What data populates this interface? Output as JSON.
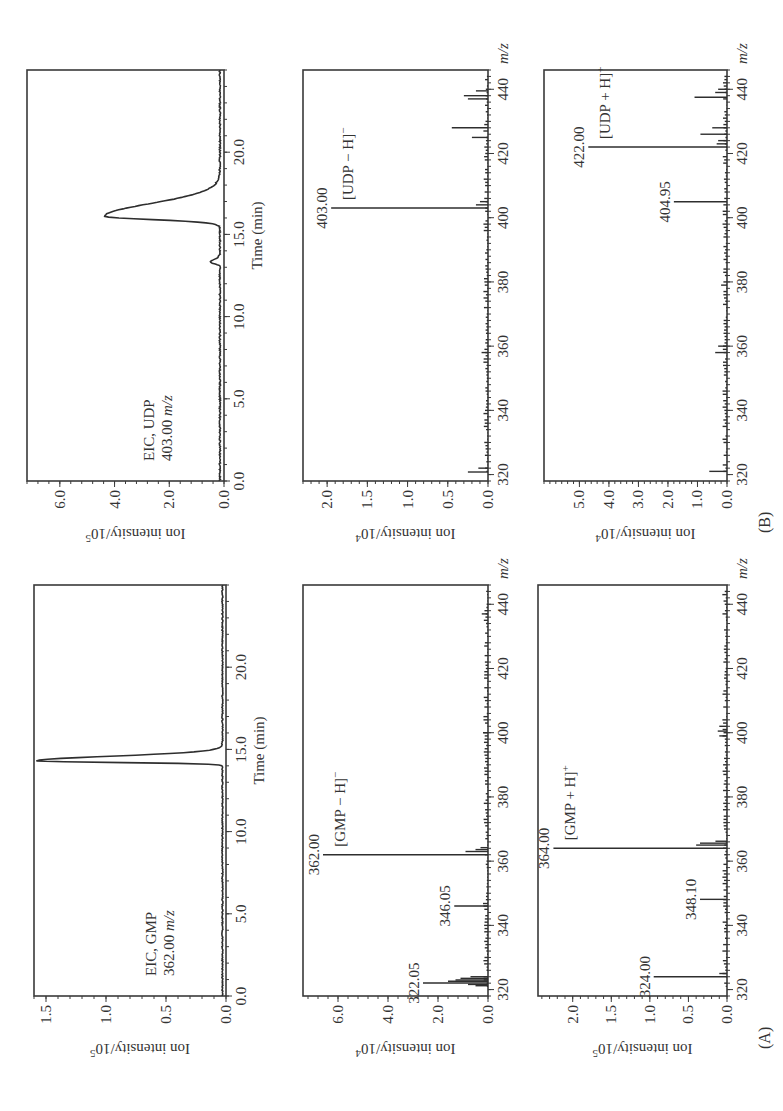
{
  "figure": {
    "panel_labels": [
      "(A)",
      "(B)"
    ],
    "colors": {
      "ink": "#2e2e2e",
      "background": "#ffffff"
    }
  },
  "chart_data": [
    {
      "id": "A-eic",
      "panel": "A",
      "type": "line",
      "title": "EIC, GMP",
      "subtitle": "362.00 m/z",
      "xlabel": "Time (min)",
      "ylabel": "Ion intensity/10^5",
      "xlim": [
        0,
        25
      ],
      "ylim": [
        0,
        1.6
      ],
      "xticks": [
        0.0,
        5.0,
        10.0,
        15.0,
        20.0
      ],
      "xtick_labels": [
        "0.0",
        "5.0",
        "10.0",
        "15.0",
        "20.0"
      ],
      "yticks": [
        0.0,
        0.5,
        1.0,
        1.5
      ],
      "ytick_labels": [
        "0.0",
        "0.5",
        "1.0",
        "1.5"
      ],
      "grid": false,
      "peaks": [
        {
          "x": 14.3,
          "y": 1.55,
          "width": 0.25,
          "tail": 0.6
        }
      ],
      "baseline": 0.03
    },
    {
      "id": "A-ms-neg",
      "panel": "A",
      "type": "bar",
      "title": "[GMP − H]⁻",
      "xlabel": "m/z",
      "ylabel": "Ion intensity/10^4",
      "xlim": [
        318,
        446
      ],
      "ylim": [
        0,
        7.4
      ],
      "xticks": [
        320,
        340,
        360,
        380,
        400,
        420,
        440
      ],
      "xtick_labels": [
        "320",
        "340",
        "360",
        "380",
        "400",
        "420",
        "440"
      ],
      "yticks": [
        0.0,
        2.0,
        4.0,
        6.0
      ],
      "ytick_labels": [
        "0.0",
        "2.0",
        "4.0",
        "6.0"
      ],
      "grid": false,
      "labeled_peaks": [
        {
          "mz": 362.0,
          "intensity": 6.6,
          "label": "362.00"
        },
        {
          "mz": 346.05,
          "intensity": 1.35,
          "label": "346.05"
        },
        {
          "mz": 322.05,
          "intensity": 2.6,
          "label": "322.05"
        }
      ],
      "minor_peaks": [
        {
          "mz": 321.2,
          "intensity": 0.5
        },
        {
          "mz": 321.6,
          "intensity": 0.8
        },
        {
          "mz": 322.6,
          "intensity": 1.6
        },
        {
          "mz": 323.0,
          "intensity": 1.3
        },
        {
          "mz": 323.5,
          "intensity": 1.1
        },
        {
          "mz": 324.0,
          "intensity": 0.7
        },
        {
          "mz": 363.0,
          "intensity": 0.9
        },
        {
          "mz": 363.6,
          "intensity": 0.5
        },
        {
          "mz": 364.2,
          "intensity": 0.3
        },
        {
          "mz": 346.8,
          "intensity": 0.2
        },
        {
          "mz": 400.0,
          "intensity": 0.2
        },
        {
          "mz": 437.0,
          "intensity": 0.25
        }
      ]
    },
    {
      "id": "A-ms-pos",
      "panel": "A",
      "type": "bar",
      "title": "[GMP + H]⁺",
      "xlabel": "m/z",
      "ylabel": "Ion intensity/10^5",
      "xlim": [
        318,
        446
      ],
      "ylim": [
        0,
        2.45
      ],
      "xticks": [
        320,
        340,
        360,
        380,
        400,
        420,
        440
      ],
      "xtick_labels": [
        "320",
        "340",
        "360",
        "380",
        "400",
        "420",
        "440"
      ],
      "yticks": [
        0.0,
        0.5,
        1.0,
        1.5,
        2.0
      ],
      "ytick_labels": [
        "0.0",
        "0.5",
        "1.0",
        "1.5",
        "2.0"
      ],
      "grid": false,
      "labeled_peaks": [
        {
          "mz": 364.0,
          "intensity": 2.25,
          "label": "364.00"
        },
        {
          "mz": 348.1,
          "intensity": 0.35,
          "label": "348.10"
        },
        {
          "mz": 324.0,
          "intensity": 0.95,
          "label": "324.00"
        }
      ],
      "minor_peaks": [
        {
          "mz": 365.0,
          "intensity": 0.4
        },
        {
          "mz": 365.6,
          "intensity": 0.35
        },
        {
          "mz": 366.2,
          "intensity": 0.15
        },
        {
          "mz": 325.0,
          "intensity": 0.1
        },
        {
          "mz": 399.0,
          "intensity": 0.1
        },
        {
          "mz": 400.5,
          "intensity": 0.12
        },
        {
          "mz": 402.0,
          "intensity": 0.1
        }
      ]
    },
    {
      "id": "B-eic",
      "panel": "B",
      "type": "line",
      "title": "EIC, UDP",
      "subtitle": "403.00 m/z",
      "xlabel": "Time (min)",
      "ylabel": "Ion intensity/10^5",
      "xlim": [
        0,
        25
      ],
      "ylim": [
        0,
        7.2
      ],
      "xticks": [
        0.0,
        5.0,
        10.0,
        15.0,
        20.0
      ],
      "xtick_labels": [
        "0.0",
        "5.0",
        "10.0",
        "15.0",
        "20.0"
      ],
      "yticks": [
        0.0,
        2.0,
        4.0,
        6.0
      ],
      "ytick_labels": [
        "0.0",
        "2.0",
        "4.0",
        "6.0"
      ],
      "grid": false,
      "peaks": [
        {
          "x": 16.1,
          "y": 4.2,
          "width": 0.55,
          "tail": 1.0
        },
        {
          "x": 13.3,
          "y": 0.35,
          "width": 0.25,
          "tail": 0
        }
      ],
      "baseline": 0.15
    },
    {
      "id": "B-ms-neg",
      "panel": "B",
      "type": "bar",
      "title": "[UDP − H]⁻",
      "xlabel": "m/z",
      "ylabel": "Ion intensity/10^4",
      "xlim": [
        318,
        446
      ],
      "ylim": [
        0,
        2.3
      ],
      "xticks": [
        320,
        340,
        360,
        380,
        400,
        420,
        440
      ],
      "xtick_labels": [
        "320",
        "340",
        "360",
        "380",
        "400",
        "420",
        "440"
      ],
      "yticks": [
        0.0,
        0.5,
        1.0,
        1.5,
        2.0
      ],
      "ytick_labels": [
        "0.0",
        "0.5",
        "1.0",
        "1.5",
        "2.0"
      ],
      "grid": false,
      "labeled_peaks": [
        {
          "mz": 403.0,
          "intensity": 1.95,
          "label": "403.00"
        }
      ],
      "minor_peaks": [
        {
          "mz": 320.8,
          "intensity": 0.25
        },
        {
          "mz": 322.0,
          "intensity": 0.12
        },
        {
          "mz": 358.0,
          "intensity": 0.08
        },
        {
          "mz": 404.0,
          "intensity": 0.15
        },
        {
          "mz": 405.0,
          "intensity": 0.1
        },
        {
          "mz": 425.0,
          "intensity": 0.2
        },
        {
          "mz": 428.0,
          "intensity": 0.45
        },
        {
          "mz": 437.0,
          "intensity": 0.25
        },
        {
          "mz": 438.0,
          "intensity": 0.3
        },
        {
          "mz": 439.5,
          "intensity": 0.15
        }
      ]
    },
    {
      "id": "B-ms-pos",
      "panel": "B",
      "type": "bar",
      "title": "[UDP + H]⁺",
      "xlabel": "m/z",
      "ylabel": "Ion intensity/10^4",
      "xlim": [
        318,
        446
      ],
      "ylim": [
        0,
        6.2
      ],
      "xticks": [
        320,
        340,
        360,
        380,
        400,
        420,
        440
      ],
      "xtick_labels": [
        "320",
        "340",
        "360",
        "380",
        "400",
        "420",
        "440"
      ],
      "yticks": [
        0.0,
        1.0,
        2.0,
        3.0,
        4.0,
        5.0
      ],
      "ytick_labels": [
        "0.0",
        "1.0",
        "2.0",
        "3.0",
        "4.0",
        "5.0"
      ],
      "grid": false,
      "labeled_peaks": [
        {
          "mz": 422.0,
          "intensity": 4.7,
          "label": "422.00"
        },
        {
          "mz": 404.95,
          "intensity": 1.8,
          "label": "404.95"
        }
      ],
      "minor_peaks": [
        {
          "mz": 321.0,
          "intensity": 0.6
        },
        {
          "mz": 358.0,
          "intensity": 0.4
        },
        {
          "mz": 360.0,
          "intensity": 0.3
        },
        {
          "mz": 379.0,
          "intensity": 0.2
        },
        {
          "mz": 423.0,
          "intensity": 0.35
        },
        {
          "mz": 424.0,
          "intensity": 0.3
        },
        {
          "mz": 426.0,
          "intensity": 0.9
        },
        {
          "mz": 428.0,
          "intensity": 0.5
        },
        {
          "mz": 437.5,
          "intensity": 1.1
        },
        {
          "mz": 439.0,
          "intensity": 0.4
        },
        {
          "mz": 440.0,
          "intensity": 0.3
        }
      ]
    }
  ],
  "layout": {
    "plots": {
      "A-eic": {
        "x": 115,
        "y": 34,
        "w": 411,
        "h": 192
      },
      "A-ms-neg": {
        "x": 115,
        "y": 303,
        "w": 411,
        "h": 185
      },
      "A-ms-pos": {
        "x": 115,
        "y": 538,
        "w": 411,
        "h": 189
      },
      "B-eic": {
        "x": 630,
        "y": 27,
        "w": 411,
        "h": 197
      },
      "B-ms-neg": {
        "x": 630,
        "y": 303,
        "w": 411,
        "h": 185
      },
      "B-ms-pos": {
        "x": 630,
        "y": 544,
        "w": 411,
        "h": 183
      }
    }
  }
}
